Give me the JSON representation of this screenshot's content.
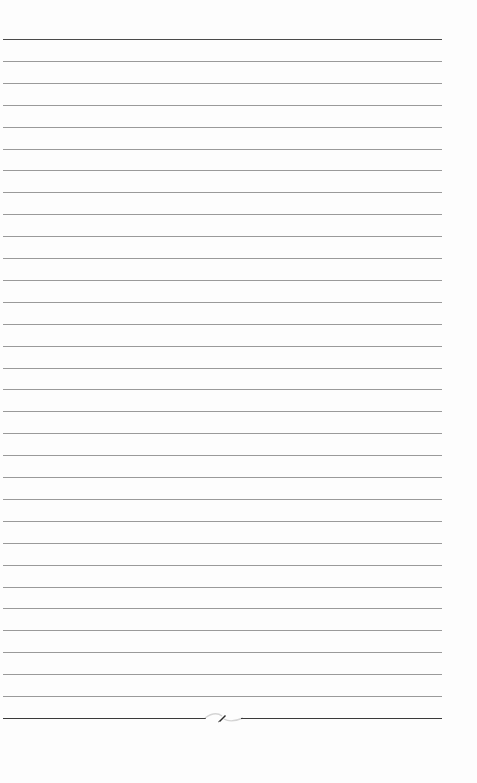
{
  "page": {
    "type": "lined-paper",
    "background_color": "#fdfdfd",
    "rule_color": "#9a9a9a",
    "heavy_rule_color": "#4a4a4a",
    "line_count": 32,
    "first_line_y": 39,
    "last_line_y": 718,
    "line_spacing": 21.9,
    "left_margin_x": 3,
    "right_edge_x": 442
  },
  "footer": {
    "ornament_icon": "quill-flourish-icon"
  }
}
